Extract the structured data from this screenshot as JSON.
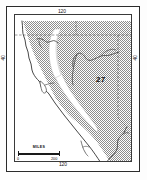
{
  "figure": {
    "type": "thematic-map",
    "title": "",
    "region_label": "27"
  },
  "graticule": {
    "top_label": "120",
    "bottom_label": "120",
    "left_label": "40",
    "right_label": "40"
  },
  "scale": {
    "title": "MILES",
    "min": "0",
    "max": "200"
  },
  "map_features": {
    "shaded_region_name": "stippled-upland-area",
    "unshaded_region_name": "central-valley",
    "coastline_name": "pacific-coastline",
    "state_border_name": "state-boundary",
    "river_name": "river-network"
  },
  "colors": {
    "frame": "#2b2b2b",
    "stipple": "#8d8d8d",
    "coastline": "#333333",
    "background": "#ffffff",
    "text": "#111111"
  }
}
